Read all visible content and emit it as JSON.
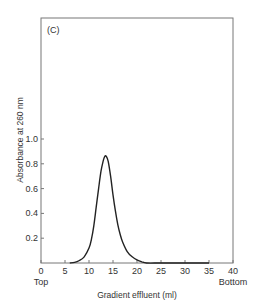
{
  "chart_data": {
    "type": "line",
    "panel_label": "(C)",
    "title": "",
    "xlabel": "Gradient effluent (ml)",
    "ylabel": "Absorbance at 260 nm",
    "xlim": [
      0,
      40
    ],
    "ylim": [
      0,
      1.0
    ],
    "x_ticks": [
      0,
      5,
      10,
      15,
      20,
      25,
      30,
      35,
      40
    ],
    "x_tick_labels": [
      "0",
      "5",
      "10",
      "15",
      "20",
      "25",
      "30",
      "35",
      "40"
    ],
    "x_end_labels": {
      "left": "Top",
      "right": "Bottom"
    },
    "y_ticks": [
      0.2,
      0.4,
      0.6,
      0.8,
      1.0
    ],
    "y_tick_labels": [
      "0.2",
      "0.4",
      "0.6",
      "0.8",
      "1.0"
    ],
    "grid": false,
    "legend": null,
    "series": [
      {
        "name": "A260",
        "x": [
          6,
          7,
          8,
          9,
          10,
          10.5,
          11,
          11.5,
          12,
          12.5,
          13,
          13.3,
          13.6,
          14,
          14.5,
          15,
          15.5,
          16,
          16.5,
          17,
          18,
          19,
          20,
          21,
          22,
          25,
          30,
          35
        ],
        "y": [
          0.0,
          0.005,
          0.02,
          0.05,
          0.12,
          0.19,
          0.3,
          0.45,
          0.6,
          0.74,
          0.83,
          0.86,
          0.86,
          0.82,
          0.7,
          0.55,
          0.42,
          0.31,
          0.23,
          0.17,
          0.09,
          0.05,
          0.025,
          0.01,
          0.0,
          0.0,
          0.0,
          0.0
        ]
      }
    ]
  }
}
